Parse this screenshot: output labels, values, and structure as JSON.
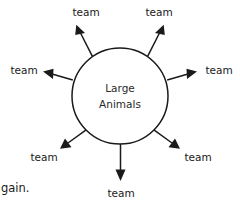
{
  "diagram": {
    "type": "radial-spoke-diagram",
    "background_color": "#ffffff",
    "stroke_color": "#1a1a1a",
    "text_color": "#1a1a1a",
    "hub": {
      "shape": "circle",
      "center_x": 120,
      "center_y": 96,
      "radius": 48,
      "line_1": "Large",
      "line_2": "Animals"
    },
    "spokes": [
      {
        "id": "top-left",
        "label": "team",
        "angle_degrees": 215,
        "label_x": 86,
        "label_y": 16,
        "anchor": "middle"
      },
      {
        "id": "top-right",
        "label": "team",
        "angle_degrees": 325,
        "label_x": 159,
        "label_y": 16,
        "anchor": "middle"
      },
      {
        "id": "left",
        "label": "team",
        "angle_degrees": 180,
        "label_x": 24,
        "label_y": 74,
        "anchor": "middle"
      },
      {
        "id": "right",
        "label": "team",
        "angle_degrees": 0,
        "label_x": 219,
        "label_y": 74,
        "anchor": "middle"
      },
      {
        "id": "bottom-left",
        "label": "team",
        "angle_degrees": 135,
        "label_x": 44,
        "label_y": 161,
        "anchor": "middle"
      },
      {
        "id": "bottom-right",
        "label": "team",
        "angle_degrees": 45,
        "label_x": 198,
        "label_y": 161,
        "anchor": "middle"
      },
      {
        "id": "bottom-center",
        "label": "team",
        "angle_degrees": 90,
        "label_x": 121,
        "label_y": 194,
        "anchor": "middle"
      }
    ]
  },
  "caption": {
    "partial_text": "gain.",
    "x": 1,
    "y": 192
  }
}
